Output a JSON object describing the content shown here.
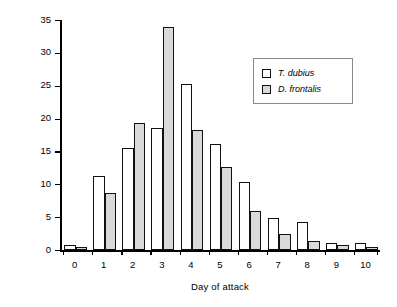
{
  "chart_data": {
    "type": "bar",
    "title": "",
    "subtitle": "",
    "xlabel": "Day of attack",
    "ylabel": "Per cent of catch",
    "categories": [
      "0",
      "1",
      "2",
      "3",
      "4",
      "5",
      "6",
      "7",
      "8",
      "9",
      "10"
    ],
    "xlim": [
      -0.5,
      10.5
    ],
    "ylim": [
      0,
      35
    ],
    "yticks": [
      "0",
      "5",
      "10",
      "15",
      "20",
      "25",
      "30",
      "35"
    ],
    "ytick_values": [
      0,
      5,
      10,
      15,
      20,
      25,
      30,
      35
    ],
    "grid": false,
    "legend_position": "upper right",
    "series": [
      {
        "name": "T. dubius",
        "fill": "#ffffff",
        "values": [
          0.8,
          11.2,
          15.5,
          18.5,
          25.3,
          16.2,
          10.3,
          4.9,
          4.3,
          1.0,
          1.1
        ]
      },
      {
        "name": "D. frontalis",
        "fill": "#d9d9d9",
        "values": [
          0.4,
          8.7,
          19.4,
          34.0,
          18.2,
          12.7,
          5.9,
          2.4,
          1.4,
          0.8,
          0.5
        ]
      }
    ]
  },
  "legend": {
    "items": [
      {
        "label": "T. dubius",
        "swatch": "legend-swatch-t-dubius"
      },
      {
        "label": "D. frontalis",
        "swatch": "legend-swatch-d-frontalis"
      }
    ]
  }
}
